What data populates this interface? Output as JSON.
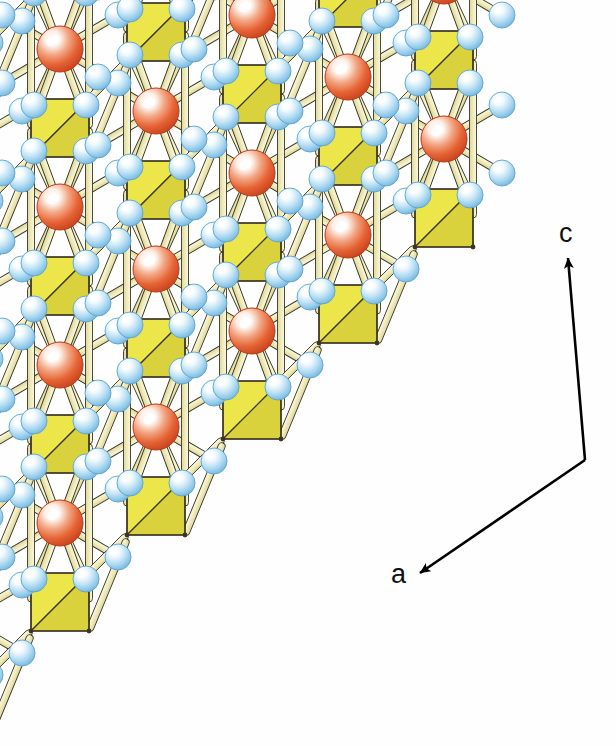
{
  "figure": {
    "kind": "crystal-structure-illustration",
    "background_color": "#ffffff"
  },
  "axes": {
    "vertical": {
      "label": "c",
      "label_x": 568,
      "label_y": 237,
      "arrow_from_x": 585,
      "arrow_from_y": 460,
      "arrow_to_x": 568,
      "arrow_to_y": 258,
      "color": "#000000"
    },
    "diagonal": {
      "label": "a",
      "label_x": 400,
      "label_y": 578,
      "arrow_from_x": 585,
      "arrow_from_y": 460,
      "arrow_to_x": 420,
      "arrow_to_y": 573,
      "color": "#000000"
    }
  },
  "legend_colors": {
    "cation_sphere": "#E0512A",
    "cation_highlight": "#FFFFFF",
    "anion_sphere": "#A9D6F0",
    "anion_highlight": "#FFFFFF",
    "tetrahedron_face_light": "#EDE64A",
    "tetrahedron_face_dark": "#D9D23C",
    "bond_stick": "#EFEBBE",
    "outline": "#3A3524"
  },
  "geometry": {
    "lattice": {
      "column_step_x": 96,
      "column_rise_y": -96,
      "cell_height": 158,
      "origin_x": -36,
      "origin_y": 540,
      "columns": 6,
      "units_per_column": 5
    },
    "sizes": {
      "cation_radius": 23,
      "anion_radius": 13,
      "tetra_half": 29,
      "bond_width": 7
    }
  },
  "chart_data": {
    "type": "scatter",
    "title": "",
    "xlabel": "a",
    "ylabel": "c",
    "note": "Schematic crystal structure; no quantitative data plotted.",
    "series": [
      {
        "name": "cation sphere (large, red-orange)",
        "count": 14
      },
      {
        "name": "anion sphere (small, pale blue)",
        "count": 56
      },
      {
        "name": "tetrahedron (yellow square)",
        "count": 20
      }
    ]
  }
}
